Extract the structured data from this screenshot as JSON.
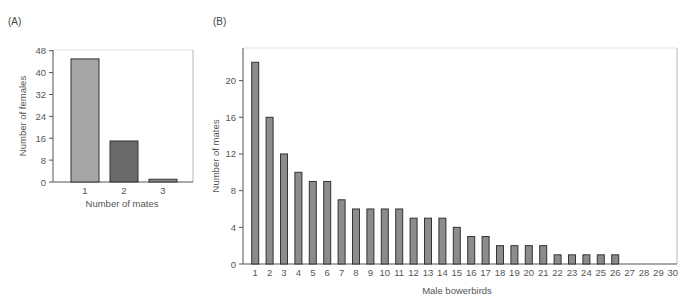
{
  "chart_data": [
    {
      "panel": "(A)",
      "type": "bar",
      "title": "",
      "xlabel": "Number of mates",
      "ylabel": "Number of females",
      "categories": [
        "1",
        "2",
        "3"
      ],
      "values": [
        45,
        15,
        1
      ],
      "bar_colors": [
        "#a6a6a6",
        "#6a6a6a",
        "#8a8a8a"
      ],
      "yticks": [
        0,
        8,
        16,
        24,
        32,
        40,
        48
      ],
      "ylim": [
        0,
        48
      ],
      "grid": false,
      "legend": null
    },
    {
      "panel": "(B)",
      "type": "bar",
      "title": "",
      "xlabel": "Male bowerbirds",
      "ylabel": "Number of mates",
      "categories": [
        "1",
        "2",
        "3",
        "4",
        "5",
        "6",
        "7",
        "8",
        "9",
        "10",
        "11",
        "12",
        "13",
        "14",
        "15",
        "16",
        "17",
        "18",
        "19",
        "20",
        "21",
        "22",
        "23",
        "24",
        "25",
        "26",
        "27",
        "28",
        "29",
        "30"
      ],
      "values": [
        22,
        16,
        12,
        10,
        9,
        9,
        7,
        6,
        6,
        6,
        6,
        5,
        5,
        5,
        4,
        3,
        3,
        2,
        2,
        2,
        2,
        1,
        1,
        1,
        1,
        1,
        0,
        0,
        0,
        0
      ],
      "bar_color": "#8c8c8c",
      "yticks": [
        0,
        4,
        8,
        12,
        16,
        20
      ],
      "ylim": [
        0,
        23.5
      ],
      "grid": false,
      "legend": null
    }
  ]
}
